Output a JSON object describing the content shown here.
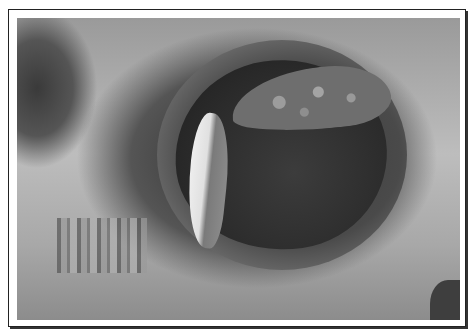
{
  "image": {
    "description": "Grayscale photograph of a rounded oval opening in a rock wall, framed with a thin black border",
    "colors": {
      "frame": "#222222",
      "background": "#ffffff",
      "rock_light": "#bdbdbd",
      "hole_dark": "#2b2b2b"
    }
  }
}
